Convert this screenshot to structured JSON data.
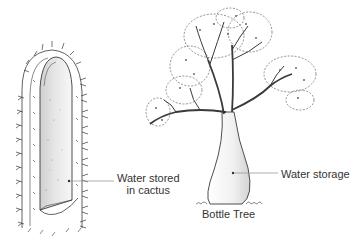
{
  "labels": {
    "cactus_line1": "Water stored",
    "cactus_line2": "in cactus",
    "bottle_water": "Water storage",
    "bottle_name": "Bottle Tree"
  },
  "colors": {
    "ink": "#3a3a3a",
    "background": "#ffffff",
    "leader_line": "#9a9a9a"
  }
}
